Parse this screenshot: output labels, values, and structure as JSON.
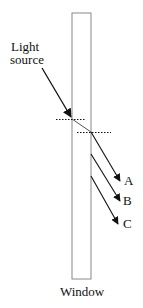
{
  "diagram": {
    "labels": {
      "light_source_line1": "Light",
      "light_source_line2": "source",
      "ray_a": "A",
      "ray_b": "B",
      "ray_c": "C",
      "window": "Window"
    },
    "colors": {
      "line": "#111111",
      "window_border": "#777777",
      "background": "#ffffff"
    }
  }
}
